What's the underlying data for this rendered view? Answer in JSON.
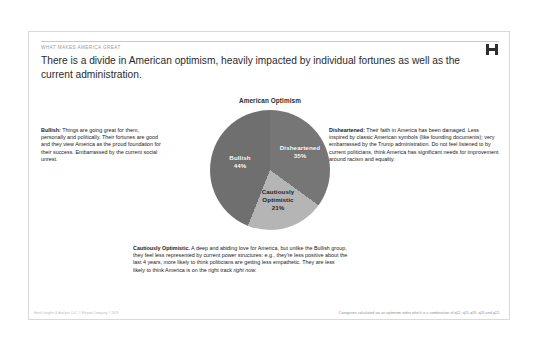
{
  "slide": {
    "eyebrow": "WHAT MAKES AMERICA GREAT",
    "headline": "There is a divide in American optimism, heavily impacted by individual fortunes as well as the current administration.",
    "logo_icon": "h-monogram-icon"
  },
  "notes": {
    "bullish": {
      "term": "Bullish:",
      "body": " Things are going great for them, personally and politically. Their fortunes are good and they view America as the proud foundation for their success. Embarrassed by the current social unrest."
    },
    "disheartened": {
      "term": "Disheartened:",
      "body": " Their faith in America has been damaged. Less inspired by classic American symbols (like founding documents); very embarrassed by the Trump administration. Do not feel listened to by current politicians, think America has significant needs for improvement around racism and equality."
    },
    "cautious": {
      "term": "Cautiously Optimistic.",
      "body": " A deep and abiding love for America, but unlike the Bullish group, they feel less represented by current power structures: e.g., they're less positive about the last 4 years, more likely to think politicians are getting less empathetic. They are less likely to think America is on the right track ",
      "emphasis": "right now."
    }
  },
  "footer": {
    "copyright": "Hatch Insights & Analysis LLC. © Elegant Company © 2019",
    "methodology": "Categories calculated via an optimism index which is a combination of q12, q15-q19, q20 and q22."
  },
  "chart_data": {
    "type": "pie",
    "title": "American Optimism",
    "categories": [
      "Disheartened",
      "Cautiously Optimistic",
      "Bullish"
    ],
    "values": [
      35,
      21,
      44
    ],
    "value_labels": [
      "35%",
      "21%",
      "44%"
    ],
    "colors": [
      "#767676",
      "#b5b5b5",
      "#6f6f6f"
    ],
    "start_angle_deg": 0,
    "direction": "clockwise",
    "legend": "none",
    "units": "percent"
  }
}
